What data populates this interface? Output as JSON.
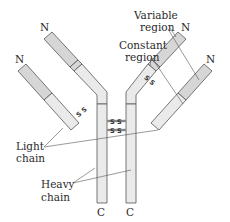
{
  "diagram": {
    "labels": {
      "variable_region_line1": "Variable",
      "variable_region_line2": "region",
      "constant_region_line1": "Constant",
      "constant_region_line2": "region",
      "light_chain_line1": "Light",
      "light_chain_line2": "chain",
      "heavy_chain_line1": "Heavy",
      "heavy_chain_line2": "chain"
    },
    "termini": {
      "n_left_outer": "N",
      "n_left_inner": "N",
      "n_right_inner": "N",
      "n_right_outer": "N",
      "c_left": "C",
      "c_right": "C"
    },
    "disulfide": {
      "label": "S S",
      "bond_symbol": "S"
    },
    "colors": {
      "variable_fill": "#d6d6d6",
      "constant_fill": "#eaeaea",
      "outline": "#555555",
      "text": "#2a2a2a"
    }
  }
}
